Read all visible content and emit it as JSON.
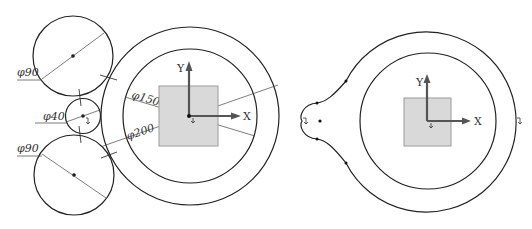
{
  "left_diagram": {
    "labels": {
      "top_circle_dia": "φ90",
      "small_circle_dia": "φ40",
      "bottom_circle_dia": "φ90",
      "inner_ring_dia": "φ150",
      "outer_ring_dia": "φ200",
      "axis_x": "X",
      "axis_y": "Y"
    }
  },
  "right_diagram": {
    "labels": {
      "axis_x": "X",
      "axis_y": "Y"
    }
  },
  "colors": {
    "stroke": "#222222",
    "square_fill": "#d9d9d9",
    "axis": "#555555"
  }
}
